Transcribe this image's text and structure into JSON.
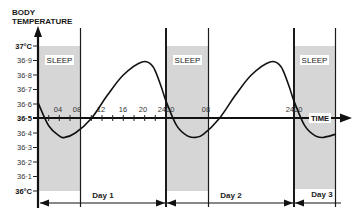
{
  "header": {
    "line1": "BODY",
    "line2": "TEMPERATURE"
  },
  "colors": {
    "sleep_fill": "#d6d6d6",
    "line": "#1a1a1a",
    "background": "#ffffff"
  },
  "chart_data": {
    "type": "line",
    "title": "",
    "ylabel": "BODY TEMPERATURE",
    "xlabel": "TIME",
    "ylim": [
      36.0,
      37.0
    ],
    "xlim_hours": [
      0,
      56
    ],
    "grid": false,
    "yticks": [
      "37°C",
      "36·9",
      "36·8",
      "36·7",
      "36·6",
      "36·5",
      "36·4",
      "36·3",
      "36·2",
      "36·1",
      "36°C"
    ],
    "xticks": [
      {
        "label": "04",
        "hour": 4
      },
      {
        "label": "08",
        "hour": 8
      },
      {
        "label": "12",
        "hour": 12
      },
      {
        "label": "16",
        "hour": 16
      },
      {
        "label": "20",
        "hour": 20
      },
      {
        "label": "2400",
        "hour": 24
      },
      {
        "label": "08",
        "hour": 32
      },
      {
        "label": "2400",
        "hour": 48
      }
    ],
    "series": [
      {
        "name": "Body temperature",
        "points": [
          [
            0,
            36.61
          ],
          [
            2,
            36.45
          ],
          [
            4,
            36.38
          ],
          [
            5,
            36.37
          ],
          [
            7,
            36.4
          ],
          [
            10,
            36.5
          ],
          [
            13,
            36.66
          ],
          [
            16,
            36.8
          ],
          [
            19.5,
            36.89
          ],
          [
            21.5,
            36.86
          ],
          [
            23,
            36.73
          ],
          [
            24,
            36.62
          ],
          [
            26,
            36.45
          ],
          [
            28,
            36.38
          ],
          [
            29.5,
            36.37
          ],
          [
            31,
            36.39
          ],
          [
            34,
            36.5
          ],
          [
            37,
            36.66
          ],
          [
            40,
            36.8
          ],
          [
            43.5,
            36.89
          ],
          [
            45.5,
            36.86
          ],
          [
            47,
            36.73
          ],
          [
            48,
            36.62
          ],
          [
            50,
            36.45
          ],
          [
            52,
            36.38
          ],
          [
            53.5,
            36.37
          ],
          [
            55.7,
            36.39
          ]
        ]
      }
    ],
    "annotations": {
      "sleep_periods": [
        {
          "label": "SLEEP",
          "start_hour": 0,
          "end_hour": 8
        },
        {
          "label": "SLEEP",
          "start_hour": 24,
          "end_hour": 32
        },
        {
          "label": "SLEEP",
          "start_hour": 48,
          "end_hour": 56
        }
      ],
      "days": [
        {
          "label": "Day 1",
          "start_hour": 0,
          "end_hour": 24
        },
        {
          "label": "Day 2",
          "start_hour": 24,
          "end_hour": 48
        },
        {
          "label": "Day 3",
          "start_hour": 48,
          "end_hour": 56
        }
      ]
    },
    "legend": null
  }
}
